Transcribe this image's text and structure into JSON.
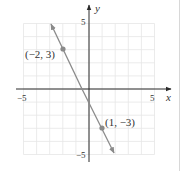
{
  "chart_data": {
    "type": "line",
    "title": "",
    "xlabel": "x",
    "ylabel": "y",
    "xlim": [
      -5,
      5
    ],
    "ylim": [
      -5,
      5
    ],
    "grid": true,
    "x_tick_labels": [
      "-5",
      "5"
    ],
    "y_tick_labels": [
      "5",
      "-5"
    ],
    "series": [
      {
        "name": "y = -2x - 1",
        "x": [
          -3,
          2
        ],
        "y": [
          5,
          -5
        ],
        "arrows_both_ends": true,
        "color": "#8a8a8a"
      }
    ],
    "points": [
      {
        "x": -2,
        "y": 3,
        "label": "(−2, 3)"
      },
      {
        "x": 1,
        "y": -3,
        "label": "(1, −3)"
      }
    ]
  },
  "labels": {
    "x_axis": "x",
    "y_axis": "y",
    "x_min": "−5",
    "x_max": "5",
    "y_max": "5",
    "y_min": "−5",
    "point_a": "(−2, 3)",
    "point_b": "(1, −3)"
  },
  "colors": {
    "grid": "#e6e6e6",
    "axis": "#2a2a2a",
    "line": "#8a8a8a"
  }
}
